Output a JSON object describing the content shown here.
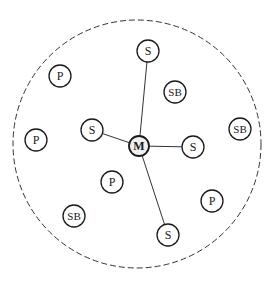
{
  "diagram": {
    "boundary": {
      "type": "dashed-circle",
      "cx": 137,
      "cy": 144,
      "r": 124,
      "color": "#333333"
    },
    "nodes": [
      {
        "id": "M",
        "label": "M",
        "x": 139,
        "y": 146,
        "r": 10,
        "role": "master"
      },
      {
        "id": "S1",
        "label": "S",
        "x": 148,
        "y": 51,
        "r": 11,
        "role": "slave"
      },
      {
        "id": "S2",
        "label": "S",
        "x": 92,
        "y": 130,
        "r": 11,
        "role": "slave"
      },
      {
        "id": "S3",
        "label": "S",
        "x": 193,
        "y": 147,
        "r": 11,
        "role": "slave"
      },
      {
        "id": "S4",
        "label": "S",
        "x": 168,
        "y": 235,
        "r": 11,
        "role": "slave"
      },
      {
        "id": "SB1",
        "label": "SB",
        "x": 175,
        "y": 92,
        "r": 11,
        "role": "standby"
      },
      {
        "id": "SB2",
        "label": "SB",
        "x": 240,
        "y": 129,
        "r": 11,
        "role": "standby"
      },
      {
        "id": "SB3",
        "label": "SB",
        "x": 74,
        "y": 216,
        "r": 11,
        "role": "standby"
      },
      {
        "id": "P1",
        "label": "P",
        "x": 60,
        "y": 76,
        "r": 11,
        "role": "parked"
      },
      {
        "id": "P2",
        "label": "P",
        "x": 36,
        "y": 140,
        "r": 11,
        "role": "parked"
      },
      {
        "id": "P3",
        "label": "P",
        "x": 112,
        "y": 182,
        "r": 11,
        "role": "parked"
      },
      {
        "id": "P4",
        "label": "P",
        "x": 212,
        "y": 201,
        "r": 11,
        "role": "parked"
      }
    ],
    "edges": [
      {
        "from": "M",
        "to": "S1"
      },
      {
        "from": "M",
        "to": "S2"
      },
      {
        "from": "M",
        "to": "S3"
      },
      {
        "from": "M",
        "to": "S4"
      }
    ],
    "colors": {
      "stroke": "#1a1a1a",
      "master_fill": "#f0f0f0",
      "node_fill": "#ffffff",
      "edge": "#333333"
    }
  }
}
